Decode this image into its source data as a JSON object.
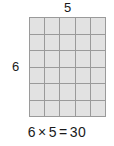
{
  "figure": {
    "type": "multiplication-array",
    "top_label": "5",
    "left_label": "6",
    "equation": {
      "full": "6 × 5 = 30",
      "left_factor": "6",
      "times_symbol": "×",
      "right_factor": "5",
      "equals_symbol": "=",
      "product": "30"
    }
  },
  "chart_data": {
    "type": "heatmap",
    "title": "6 × 5 = 30",
    "xlabel": "5",
    "ylabel": "6",
    "rows": 6,
    "columns": 5,
    "total_cells": 30,
    "grid": true,
    "legend": "none",
    "cell_fill": "#e2e2e2",
    "grid_line_color": "#9a9a9a",
    "background": "#ffffff",
    "text_color": "#1a1a1a",
    "values": [
      [
        1,
        1,
        1,
        1,
        1
      ],
      [
        1,
        1,
        1,
        1,
        1
      ],
      [
        1,
        1,
        1,
        1,
        1
      ],
      [
        1,
        1,
        1,
        1,
        1
      ],
      [
        1,
        1,
        1,
        1,
        1
      ],
      [
        1,
        1,
        1,
        1,
        1
      ]
    ]
  }
}
